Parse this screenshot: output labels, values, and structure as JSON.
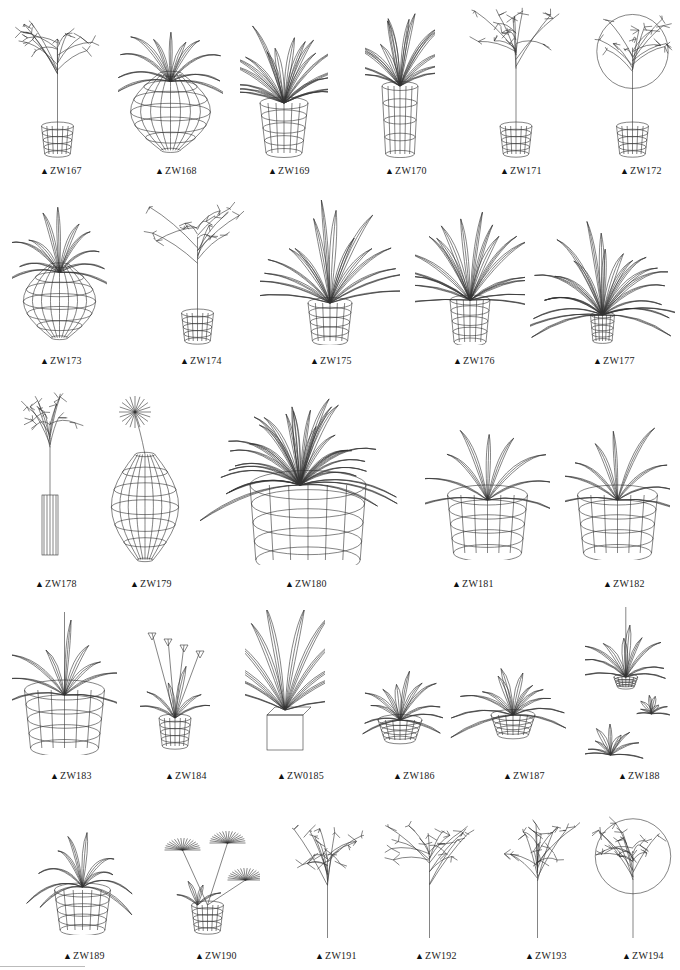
{
  "page": {
    "background": "#ffffff",
    "label_marker": "▲"
  },
  "rows": [
    {
      "items": [
        {
          "code": "ZW167",
          "type": "tree",
          "x": 15,
          "y": 10,
          "w": 85,
          "h": 148,
          "lx": 40,
          "ly": 165
        },
        {
          "code": "ZW168",
          "type": "broadleaf-vase",
          "x": 118,
          "y": 5,
          "w": 105,
          "h": 153,
          "lx": 155,
          "ly": 165
        },
        {
          "code": "ZW169",
          "type": "spiky-pot",
          "x": 240,
          "y": 8,
          "w": 88,
          "h": 150,
          "lx": 268,
          "ly": 165
        },
        {
          "code": "ZW170",
          "type": "grass-tallpot",
          "x": 365,
          "y": 12,
          "w": 70,
          "h": 146,
          "lx": 385,
          "ly": 165
        },
        {
          "code": "ZW171",
          "type": "tree",
          "x": 460,
          "y": 5,
          "w": 112,
          "h": 153,
          "lx": 500,
          "ly": 165
        },
        {
          "code": "ZW172",
          "type": "tree-round",
          "x": 590,
          "y": 10,
          "w": 85,
          "h": 148,
          "lx": 620,
          "ly": 165
        }
      ]
    },
    {
      "items": [
        {
          "code": "ZW173",
          "type": "broadleaf-vase",
          "x": 12,
          "y": 200,
          "w": 95,
          "h": 145,
          "lx": 40,
          "ly": 355
        },
        {
          "code": "ZW174",
          "type": "tree",
          "x": 140,
          "y": 200,
          "w": 115,
          "h": 145,
          "lx": 180,
          "ly": 355
        },
        {
          "code": "ZW175",
          "type": "grass-pot",
          "x": 260,
          "y": 200,
          "w": 140,
          "h": 145,
          "lx": 310,
          "ly": 355
        },
        {
          "code": "ZW176",
          "type": "palm-pot",
          "x": 415,
          "y": 195,
          "w": 110,
          "h": 150,
          "lx": 453,
          "ly": 355
        },
        {
          "code": "ZW177",
          "type": "fern",
          "x": 530,
          "y": 200,
          "w": 145,
          "h": 145,
          "lx": 593,
          "ly": 355
        }
      ]
    },
    {
      "items": [
        {
          "code": "ZW178",
          "type": "flower-tube",
          "x": 15,
          "y": 385,
          "w": 70,
          "h": 175,
          "lx": 35,
          "ly": 578
        },
        {
          "code": "ZW179",
          "type": "daisy-vase",
          "x": 105,
          "y": 395,
          "w": 80,
          "h": 170,
          "lx": 130,
          "ly": 578
        },
        {
          "code": "ZW180",
          "type": "big-grass",
          "x": 200,
          "y": 380,
          "w": 200,
          "h": 185,
          "lx": 285,
          "ly": 578
        },
        {
          "code": "ZW181",
          "type": "agave-pot",
          "x": 425,
          "y": 405,
          "w": 125,
          "h": 155,
          "lx": 452,
          "ly": 578
        },
        {
          "code": "ZW182",
          "type": "agave-pot",
          "x": 565,
          "y": 405,
          "w": 105,
          "h": 155,
          "lx": 603,
          "ly": 578
        }
      ]
    },
    {
      "items": [
        {
          "code": "ZW183",
          "type": "leafy-pot",
          "x": 12,
          "y": 610,
          "w": 105,
          "h": 145,
          "lx": 50,
          "ly": 770
        },
        {
          "code": "ZW184",
          "type": "tulip-pot",
          "x": 140,
          "y": 625,
          "w": 70,
          "h": 125,
          "lx": 165,
          "ly": 770
        },
        {
          "code": "ZW0185",
          "type": "sword-box",
          "x": 245,
          "y": 610,
          "w": 80,
          "h": 145,
          "lx": 277,
          "ly": 770
        },
        {
          "code": "ZW186",
          "type": "rosette-low",
          "x": 340,
          "y": 650,
          "w": 120,
          "h": 95,
          "lx": 393,
          "ly": 770
        },
        {
          "code": "ZW187",
          "type": "rosette-low",
          "x": 448,
          "y": 655,
          "w": 130,
          "h": 85,
          "lx": 503,
          "ly": 770
        },
        {
          "code": "ZW188",
          "type": "hanging",
          "x": 585,
          "y": 605,
          "w": 85,
          "h": 160,
          "lx": 618,
          "ly": 770
        }
      ]
    },
    {
      "items": [
        {
          "code": "ZW189",
          "type": "droop-pot",
          "x": 15,
          "y": 815,
          "w": 135,
          "h": 120,
          "lx": 63,
          "ly": 950
        },
        {
          "code": "ZW190",
          "type": "fan-palm",
          "x": 155,
          "y": 825,
          "w": 105,
          "h": 110,
          "lx": 195,
          "ly": 950
        },
        {
          "code": "ZW191",
          "type": "bare-tree",
          "x": 290,
          "y": 820,
          "w": 75,
          "h": 120,
          "lx": 315,
          "ly": 950
        },
        {
          "code": "ZW192",
          "type": "bare-tree",
          "x": 382,
          "y": 815,
          "w": 95,
          "h": 125,
          "lx": 415,
          "ly": 950
        },
        {
          "code": "ZW193",
          "type": "bare-tree",
          "x": 495,
          "y": 815,
          "w": 85,
          "h": 125,
          "lx": 525,
          "ly": 950
        },
        {
          "code": "ZW194",
          "type": "bare-tree-round",
          "x": 592,
          "y": 815,
          "w": 82,
          "h": 125,
          "lx": 622,
          "ly": 950
        }
      ]
    }
  ]
}
